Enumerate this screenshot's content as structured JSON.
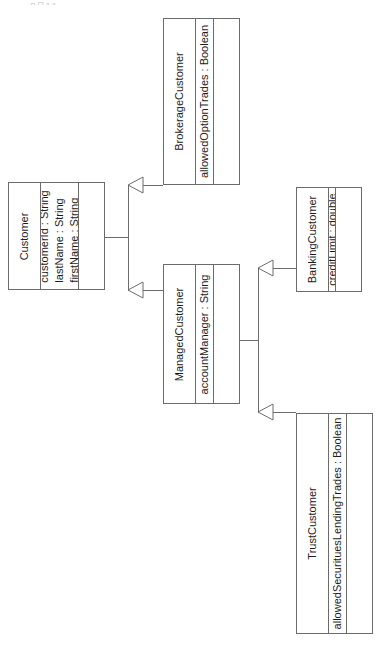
{
  "page": {
    "orientation": "rotated-90",
    "background_color": "#ffffff",
    "border_color": "#6b6b6b",
    "text_color": "#1c1c1c",
    "top_fragment_text": "——  —○  □ ▫ ▫"
  },
  "classes": [
    {
      "id": "customer",
      "name": "Customer",
      "attributes": [
        "customerId : String",
        "lastName : String",
        "firstName : String"
      ],
      "operations": []
    },
    {
      "id": "brokerage-customer",
      "name": "BrokerageCustomer",
      "attributes": [
        "allowedOptionTrades : Boolean"
      ],
      "operations": []
    },
    {
      "id": "managed-customer",
      "name": "ManagedCustomer",
      "attributes": [
        "accountManager : String"
      ],
      "operations": []
    },
    {
      "id": "banking-customer",
      "name": "BankingCustomer",
      "attributes": [
        "creditLimit : double"
      ],
      "operations": []
    },
    {
      "id": "trust-customer",
      "name": "TrustCustomer",
      "attributes": [
        "allowedSecurituesLendingTrades : Boolean"
      ],
      "operations": []
    }
  ],
  "relationships": [
    {
      "type": "generalization",
      "from": "BrokerageCustomer",
      "to": "Customer"
    },
    {
      "type": "generalization",
      "from": "ManagedCustomer",
      "to": "Customer"
    },
    {
      "type": "generalization",
      "from": "BankingCustomer",
      "to": "ManagedCustomer"
    },
    {
      "type": "generalization",
      "from": "TrustCustomer",
      "to": "ManagedCustomer"
    }
  ]
}
